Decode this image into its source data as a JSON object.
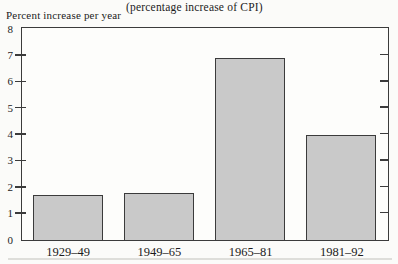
{
  "page": {
    "background": "#fbfbf9",
    "axis_color": "#3b3b3b",
    "text_color": "#1c1c1c"
  },
  "chart": {
    "title": "(percentage increase of CPI)",
    "y_axis_caption": "Percent increase per year"
  },
  "chart_data": {
    "type": "bar",
    "title": "(percentage increase of CPI)",
    "ylabel": "Percent increase per year",
    "xlabel": "",
    "categories": [
      "1929–49",
      "1949–65",
      "1965–81",
      "1981–92"
    ],
    "values": [
      1.7,
      1.8,
      6.9,
      4.0
    ],
    "ylim": [
      0,
      8
    ],
    "yticks": [
      0,
      1,
      2,
      3,
      4,
      5,
      6,
      7,
      8
    ],
    "grid": false,
    "legend": null,
    "bar_fill": "#c9c9c9",
    "bar_border": "#3b3b3b"
  }
}
